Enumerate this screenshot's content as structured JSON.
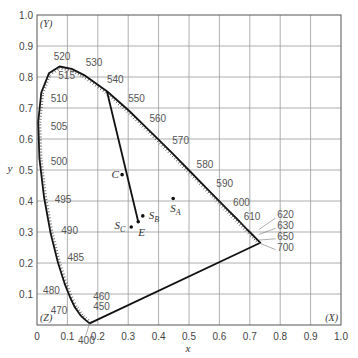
{
  "chart_data": {
    "type": "scatter",
    "xlabel": "x",
    "ylabel": "y",
    "xlim": [
      0,
      1.0
    ],
    "ylim": [
      0,
      1.0
    ],
    "grid": true,
    "x_ticks": [
      "0",
      "0.1",
      "0.2",
      "0.3",
      "0.4",
      "0.5",
      "0.6",
      "0.7",
      "0.8",
      "0.9",
      "1.0"
    ],
    "y_ticks": [
      "0.1",
      "0.2",
      "0.3",
      "0.4",
      "0.5",
      "0.6",
      "0.7",
      "0.8",
      "0.9",
      "1.0"
    ],
    "corner_labels": [
      {
        "label": "(Y)",
        "x": 0.0,
        "y": 1.0
      },
      {
        "label": "(Z)",
        "x": 0.0,
        "y": 0.0
      },
      {
        "label": "(X)",
        "x": 1.0,
        "y": 0.0
      }
    ],
    "spectral_locus": [
      {
        "nm": 400,
        "x": 0.173,
        "y": 0.005
      },
      {
        "nm": 450,
        "x": 0.157,
        "y": 0.018
      },
      {
        "nm": 460,
        "x": 0.144,
        "y": 0.03
      },
      {
        "nm": 470,
        "x": 0.124,
        "y": 0.058
      },
      {
        "nm": 475,
        "x": 0.11,
        "y": 0.087
      },
      {
        "nm": 480,
        "x": 0.091,
        "y": 0.133
      },
      {
        "nm": 485,
        "x": 0.069,
        "y": 0.201
      },
      {
        "nm": 490,
        "x": 0.045,
        "y": 0.295
      },
      {
        "nm": 495,
        "x": 0.023,
        "y": 0.413
      },
      {
        "nm": 500,
        "x": 0.008,
        "y": 0.538
      },
      {
        "nm": 505,
        "x": 0.004,
        "y": 0.655
      },
      {
        "nm": 510,
        "x": 0.014,
        "y": 0.75
      },
      {
        "nm": 515,
        "x": 0.039,
        "y": 0.812
      },
      {
        "nm": 520,
        "x": 0.074,
        "y": 0.834
      },
      {
        "nm": 525,
        "x": 0.114,
        "y": 0.826
      },
      {
        "nm": 530,
        "x": 0.155,
        "y": 0.806
      },
      {
        "nm": 540,
        "x": 0.23,
        "y": 0.754
      },
      {
        "nm": 550,
        "x": 0.302,
        "y": 0.692
      },
      {
        "nm": 560,
        "x": 0.373,
        "y": 0.624
      },
      {
        "nm": 570,
        "x": 0.444,
        "y": 0.555
      },
      {
        "nm": 580,
        "x": 0.512,
        "y": 0.487
      },
      {
        "nm": 590,
        "x": 0.575,
        "y": 0.424
      },
      {
        "nm": 600,
        "x": 0.627,
        "y": 0.372
      },
      {
        "nm": 610,
        "x": 0.666,
        "y": 0.334
      },
      {
        "nm": 620,
        "x": 0.691,
        "y": 0.308
      },
      {
        "nm": 630,
        "x": 0.708,
        "y": 0.292
      },
      {
        "nm": 650,
        "x": 0.726,
        "y": 0.274
      },
      {
        "nm": 700,
        "x": 0.735,
        "y": 0.265
      }
    ],
    "wavelength_labels": [
      {
        "label": "520",
        "lx": 0.055,
        "ly": 0.855
      },
      {
        "label": "530",
        "lx": 0.16,
        "ly": 0.835
      },
      {
        "label": "540",
        "lx": 0.23,
        "ly": 0.78
      },
      {
        "label": "515",
        "lx": 0.07,
        "ly": 0.795
      },
      {
        "label": "510",
        "lx": 0.045,
        "ly": 0.72
      },
      {
        "label": "505",
        "lx": 0.045,
        "ly": 0.63
      },
      {
        "label": "500",
        "lx": 0.045,
        "ly": 0.515
      },
      {
        "label": "495",
        "lx": 0.058,
        "ly": 0.395
      },
      {
        "label": "490",
        "lx": 0.08,
        "ly": 0.295
      },
      {
        "label": "485",
        "lx": 0.1,
        "ly": 0.205
      },
      {
        "label": "480",
        "lx": 0.02,
        "ly": 0.1
      },
      {
        "label": "470",
        "lx": 0.045,
        "ly": 0.035
      },
      {
        "label": "460",
        "lx": 0.185,
        "ly": 0.08
      },
      {
        "label": "450",
        "lx": 0.185,
        "ly": 0.048
      },
      {
        "label": "400",
        "lx": 0.135,
        "ly": -0.06
      },
      {
        "label": "550",
        "lx": 0.3,
        "ly": 0.72
      },
      {
        "label": "560",
        "lx": 0.37,
        "ly": 0.655
      },
      {
        "label": "570",
        "lx": 0.445,
        "ly": 0.585
      },
      {
        "label": "580",
        "lx": 0.525,
        "ly": 0.505
      },
      {
        "label": "590",
        "lx": 0.59,
        "ly": 0.445
      },
      {
        "label": "600",
        "lx": 0.645,
        "ly": 0.385
      },
      {
        "label": "610",
        "lx": 0.68,
        "ly": 0.34
      },
      {
        "label": "620",
        "lx": 0.79,
        "ly": 0.345
      },
      {
        "label": "630",
        "lx": 0.79,
        "ly": 0.31
      },
      {
        "label": "650",
        "lx": 0.79,
        "ly": 0.275
      },
      {
        "label": "700",
        "lx": 0.79,
        "ly": 0.24
      }
    ],
    "line_540_to_E": {
      "from": {
        "x": 0.23,
        "y": 0.754
      },
      "to": {
        "x": 0.333,
        "y": 0.333
      }
    },
    "points": [
      {
        "name": "C",
        "x": 0.28,
        "y": 0.485,
        "label_dx": -0.035,
        "label_dy": -0.01
      },
      {
        "name": "S_A",
        "x": 0.448,
        "y": 0.408,
        "label_dx": -0.01,
        "label_dy": -0.045
      },
      {
        "name": "S_B",
        "x": 0.348,
        "y": 0.352,
        "label_dx": 0.02,
        "label_dy": -0.01
      },
      {
        "name": "S_C",
        "x": 0.31,
        "y": 0.316,
        "label_dx": -0.055,
        "label_dy": -0.005
      },
      {
        "name": "E",
        "x": 0.333,
        "y": 0.333,
        "label_dx": 0.0,
        "label_dy": -0.045
      }
    ],
    "colors": {
      "curve": "#111111",
      "grid": "#9a9a9a",
      "text": "#444444"
    }
  }
}
